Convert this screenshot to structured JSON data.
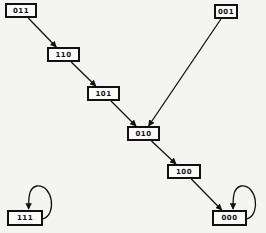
{
  "diagram": {
    "type": "state-transition-graph",
    "nodes": [
      {
        "id": "011",
        "label": "011",
        "x": 5,
        "y": 3,
        "w": 32,
        "h": 15
      },
      {
        "id": "110",
        "label": "110",
        "x": 47,
        "y": 47,
        "w": 33,
        "h": 15
      },
      {
        "id": "101",
        "label": "101",
        "x": 87,
        "y": 86,
        "w": 33,
        "h": 15
      },
      {
        "id": "001",
        "label": "001",
        "x": 214,
        "y": 4,
        "w": 24,
        "h": 15
      },
      {
        "id": "010",
        "label": "010",
        "x": 127,
        "y": 126,
        "w": 33,
        "h": 15
      },
      {
        "id": "100",
        "label": "100",
        "x": 167,
        "y": 164,
        "w": 34,
        "h": 15
      },
      {
        "id": "000",
        "label": "000",
        "x": 212,
        "y": 210,
        "w": 35,
        "h": 16
      },
      {
        "id": "111",
        "label": "111",
        "x": 7,
        "y": 210,
        "w": 36,
        "h": 16
      }
    ],
    "edges": [
      {
        "from": "011",
        "to": "110"
      },
      {
        "from": "110",
        "to": "101"
      },
      {
        "from": "101",
        "to": "010"
      },
      {
        "from": "001",
        "to": "010"
      },
      {
        "from": "010",
        "to": "100"
      },
      {
        "from": "100",
        "to": "000"
      },
      {
        "from": "000",
        "to": "000",
        "self_loop": true
      },
      {
        "from": "111",
        "to": "111",
        "self_loop": true
      }
    ],
    "colors": {
      "line": "#111111",
      "background": "#f4f4f2",
      "node_fill": "#fafaf8"
    }
  }
}
